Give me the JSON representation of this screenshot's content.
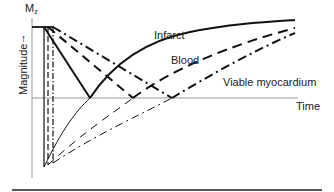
{
  "figure": {
    "y_axis_label": "Magnitude",
    "y_axis_arrow": "↑",
    "y_axis_symbol": "M",
    "y_axis_symbol_sub": "z",
    "x_axis_label": "Time"
  },
  "series": [
    {
      "name": "Infarct",
      "line_style": "solid",
      "color": "#111111",
      "null_point_x_px": 90,
      "label": "Infarct"
    },
    {
      "name": "Blood",
      "line_style": "dashed",
      "color": "#111111",
      "null_point_x_px": 133,
      "label": "Blood"
    },
    {
      "name": "Viable myocardium",
      "line_style": "dash-dot",
      "color": "#111111",
      "null_point_x_px": 172,
      "label": "Viable myocardium"
    }
  ],
  "colors": {
    "axis": "#999999",
    "curves": "#111111",
    "rule": "#222222",
    "background": "#ffffff"
  }
}
